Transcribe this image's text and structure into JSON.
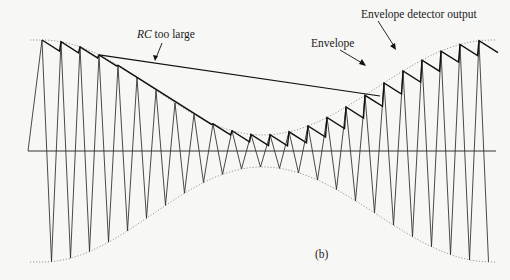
{
  "figure": {
    "caption": "(b)",
    "labels": {
      "rc_too_large_italic": "RC",
      "rc_too_large_rest": " too large",
      "envelope": "Envelope",
      "detector_output": "Envelope detector output"
    },
    "colors": {
      "background": "#f7f7f5",
      "carrier": "#2a2a2a",
      "detector_output": "#111111",
      "envelope": "#9a9a9a",
      "axis": "#333333"
    },
    "geometry": {
      "x_start": 42,
      "x_end": 492,
      "baseline_y": 151,
      "carrier_period_px": 19,
      "envelope_top_edge_y": 40,
      "envelope_top_min_y": 135,
      "envelope_min_x": 262,
      "envelope_bottom_edge_y": 262,
      "envelope_bottom_max_y": 167,
      "detector_decay_per_period": 12
    }
  }
}
